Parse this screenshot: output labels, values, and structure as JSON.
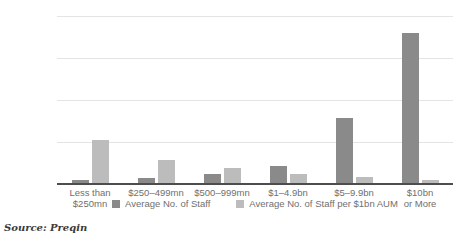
{
  "chart_data": {
    "type": "bar",
    "title": "",
    "xlabel": "",
    "ylabel": "Number of Staff",
    "ylim": [
      0,
      300
    ],
    "yticks": [
      0,
      75,
      150,
      225,
      300
    ],
    "ytick_labels": [
      "0",
      "75",
      "150",
      "225",
      "300"
    ],
    "grid": true,
    "legend_position": "bottom-center",
    "categories": [
      "Less than $250mn",
      "$250–499mn",
      "$500–999mn",
      "$1–4.9bn",
      "$5–9.9bn",
      "$10bn or More"
    ],
    "category_lines": [
      [
        "Less than",
        "$250mn"
      ],
      [
        "$250–499mn"
      ],
      [
        "$500–999mn"
      ],
      [
        "$1–4.9bn"
      ],
      [
        "$5–9.9bn"
      ],
      [
        "$10bn",
        "or More"
      ]
    ],
    "series": [
      {
        "name": "Average No. of Staff",
        "color": "#8a8a8a",
        "values": [
          8,
          11,
          18,
          33,
          118,
          270
        ]
      },
      {
        "name": "Average No. of Staff per $1bn AUM",
        "color": "#bcbcbc",
        "values": [
          78,
          42,
          28,
          17,
          13,
          8
        ]
      }
    ]
  },
  "source": {
    "text": "Source: Preqin"
  },
  "colors": {
    "series_dark": "#8a8a8a",
    "series_light": "#bcbcbc",
    "gridline": "#e4e4e4",
    "axis": "#4d4d4d",
    "text": "#6f6f6f",
    "background": "#ffffff"
  }
}
